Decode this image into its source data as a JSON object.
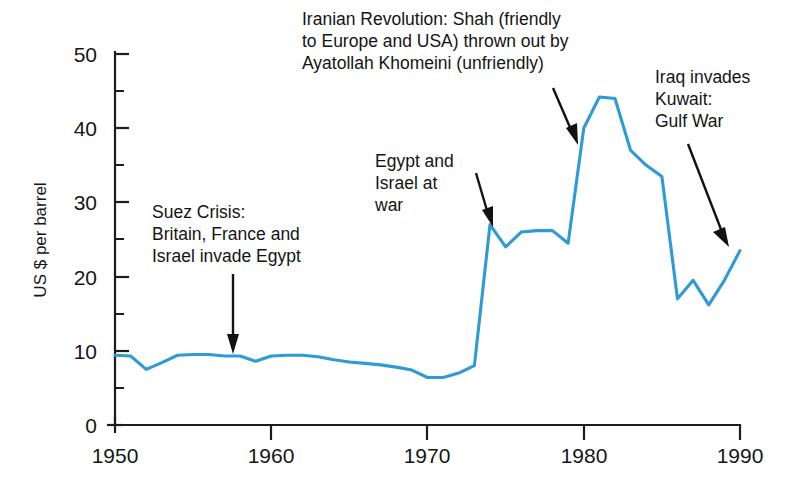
{
  "chart_data": {
    "type": "line",
    "title": "",
    "subtitle": "",
    "xlabel": "",
    "ylabel": "US $ per barrel",
    "xlim": [
      1950,
      1990
    ],
    "ylim": [
      0,
      50
    ],
    "grid": false,
    "legend": "none",
    "line_color": "#2E9BD6",
    "x_ticks": [
      "1950",
      "1960",
      "1970",
      "1980",
      "1990"
    ],
    "x_tick_values": [
      1950,
      1960,
      1970,
      1980,
      1990
    ],
    "y_ticks": [
      "0",
      "10",
      "20",
      "30",
      "40",
      "50"
    ],
    "y_tick_values": [
      0,
      10,
      20,
      30,
      40,
      50
    ],
    "y_minor_ticks": [
      5,
      15,
      25,
      35,
      45
    ],
    "series": [
      {
        "name": "Crude oil price",
        "x": [
          1950,
          1951,
          1952,
          1953,
          1954,
          1955,
          1956,
          1957,
          1958,
          1959,
          1960,
          1961,
          1962,
          1963,
          1964,
          1965,
          1966,
          1967,
          1968,
          1969,
          1970,
          1971,
          1972,
          1973,
          1974,
          1975,
          1976,
          1977,
          1978,
          1979,
          1980,
          1981,
          1982,
          1983,
          1984,
          1985,
          1986,
          1987,
          1988,
          1989,
          1990
        ],
        "values": [
          9.4,
          9.3,
          7.5,
          8.4,
          9.4,
          9.5,
          9.5,
          9.3,
          9.3,
          8.6,
          9.3,
          9.4,
          9.4,
          9.2,
          8.8,
          8.5,
          8.3,
          8.1,
          7.8,
          7.4,
          6.4,
          6.4,
          7.0,
          8.0,
          27.0,
          24.0,
          26.0,
          26.2,
          26.2,
          24.5,
          40.0,
          44.2,
          44.0,
          37.0,
          35.0,
          33.5,
          17.0,
          19.5,
          16.2,
          19.5,
          23.5
        ]
      }
    ],
    "annotations": [
      {
        "id": "suez",
        "lines": [
          "Suez Crisis:",
          "Britain, France and",
          "Israel invade Egypt"
        ],
        "target_year": 1957,
        "target_value": 9.4
      },
      {
        "id": "iranian-revolution",
        "lines": [
          "Iranian Revolution: Shah (friendly",
          "to Europe and USA) thrown out by",
          "Ayatollah Khomeini (unfriendly)"
        ],
        "target_year": 1979,
        "target_value": 38.0
      },
      {
        "id": "egypt-israel-war",
        "lines": [
          "Egypt and",
          "Israel at",
          "war"
        ],
        "target_year": 1974,
        "target_value": 27.0
      },
      {
        "id": "gulf-war",
        "lines": [
          "Iraq invades",
          "Kuwait:",
          "Gulf War"
        ],
        "target_year": 1990,
        "target_value": 23.5
      }
    ]
  }
}
